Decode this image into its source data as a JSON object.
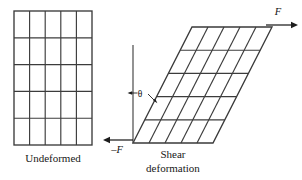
{
  "figure": {
    "background_color": "#ffffff",
    "line_color": "#3c3c3c",
    "text_color": "#171717"
  },
  "undeformed": {
    "label": "Undeformed",
    "columns": 5,
    "rows": 5,
    "left": 14,
    "top": 11,
    "width": 78,
    "height": 134
  },
  "sheared": {
    "label_line1": "Shear",
    "label_line2": "deformation",
    "columns": 5,
    "rows": 5,
    "origin_x": 133,
    "origin_y": 143,
    "width": 80,
    "height": 116,
    "shear_offset": 59
  },
  "annotations": {
    "angle_symbol": "θ",
    "force_top": "F",
    "force_bottom": "–F"
  }
}
